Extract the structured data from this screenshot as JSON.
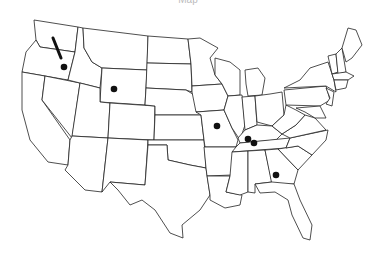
{
  "caption": "Map",
  "map": {
    "title": "United States",
    "stroke_color": "#222222",
    "marker_color": "#111111",
    "route": {
      "name": "Oregon-Idaho segment",
      "from": [
        53,
        38
      ],
      "to": [
        61,
        58
      ]
    },
    "markers": [
      {
        "name": "Eastern Oregon / Idaho border",
        "x": 64,
        "y": 67
      },
      {
        "name": "Wyoming",
        "x": 114,
        "y": 89
      },
      {
        "name": "Missouri",
        "x": 217,
        "y": 126
      },
      {
        "name": "Kentucky west",
        "x": 248,
        "y": 139
      },
      {
        "name": "Kentucky",
        "x": 254,
        "y": 143
      },
      {
        "name": "Georgia",
        "x": 276,
        "y": 175
      }
    ]
  }
}
